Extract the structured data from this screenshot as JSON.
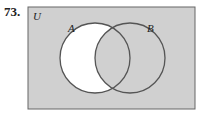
{
  "problem_number": "73.",
  "diagram": {
    "universe_label": "U",
    "sets": [
      {
        "label": "A"
      },
      {
        "label": "B"
      }
    ],
    "shaded_region": "complement of (A minus B)",
    "colors": {
      "shade": "#d0d0d0",
      "unshaded": "#ffffff",
      "outline": "#555555"
    }
  }
}
